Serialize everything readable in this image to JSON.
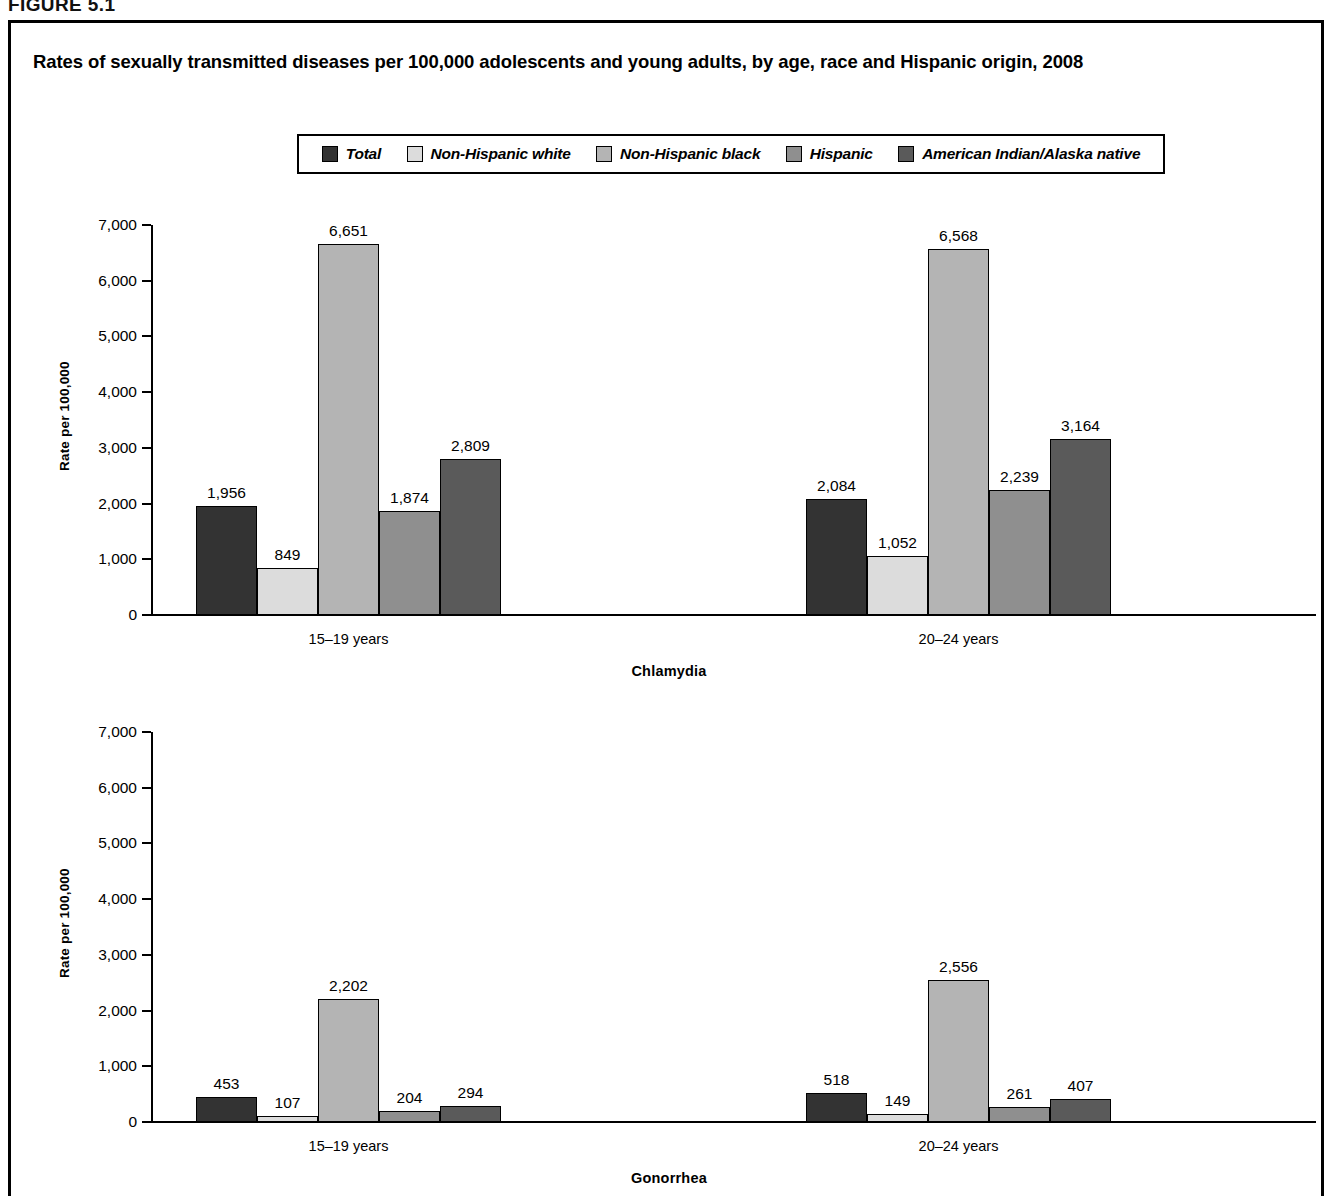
{
  "figure": {
    "label": "FIGURE 5.1",
    "title": "Rates of sexually transmitted diseases per 100,000 adolescents and young adults, by age, race and Hispanic origin, 2008"
  },
  "legend": {
    "items": [
      {
        "label": "Total",
        "color": "#333333"
      },
      {
        "label": "Non-Hispanic white",
        "color": "#dcdcdc"
      },
      {
        "label": "Non-Hispanic black",
        "color": "#b4b4b4"
      },
      {
        "label": "Hispanic",
        "color": "#8f8f8f"
      },
      {
        "label": "American Indian/Alaska native",
        "color": "#5a5a5a"
      }
    ]
  },
  "axis": {
    "ylabel": "Rate per 100,000",
    "ticks": [
      "7,000",
      "6,000",
      "5,000",
      "4,000",
      "3,000",
      "2,000",
      "1,000",
      "0"
    ]
  },
  "groups": {
    "g1": "15–19 years",
    "g2": "20–24 years"
  },
  "panels": {
    "chlamydia": {
      "label": "Chlamydia",
      "g1": {
        "values": [
          "1,956",
          "849",
          "6,651",
          "1,874",
          "2,809"
        ]
      },
      "g2": {
        "values": [
          "2,084",
          "1,052",
          "6,568",
          "2,239",
          "3,164"
        ]
      }
    },
    "gonorrhea": {
      "label": "Gonorrhea",
      "g1": {
        "values": [
          "453",
          "107",
          "2,202",
          "204",
          "294"
        ]
      },
      "g2": {
        "values": [
          "518",
          "149",
          "2,556",
          "261",
          "407"
        ]
      }
    }
  },
  "chart_data": {
    "type": "bar",
    "title": "Rates of sexually transmitted diseases per 100,000 adolescents and young adults, by age, race and Hispanic origin, 2008",
    "xlabel": "",
    "ylabel": "Rate per 100,000",
    "ylim": [
      0,
      7000
    ],
    "ytick_step": 1000,
    "grid": false,
    "legend_position": "top-center",
    "legend_entries": [
      "Total",
      "Non-Hispanic white",
      "Non-Hispanic black",
      "Hispanic",
      "American Indian/Alaska native"
    ],
    "panels": [
      {
        "name": "Chlamydia",
        "categories": [
          "15–19 years",
          "20–24 years"
        ],
        "series": [
          {
            "name": "Total",
            "values": [
              1956,
              2084
            ]
          },
          {
            "name": "Non-Hispanic white",
            "values": [
              849,
              1052
            ]
          },
          {
            "name": "Non-Hispanic black",
            "values": [
              6651,
              6568
            ]
          },
          {
            "name": "Hispanic",
            "values": [
              1874,
              2239
            ]
          },
          {
            "name": "American Indian/Alaska native",
            "values": [
              2809,
              3164
            ]
          }
        ]
      },
      {
        "name": "Gonorrhea",
        "categories": [
          "15–19 years",
          "20–24 years"
        ],
        "series": [
          {
            "name": "Total",
            "values": [
              453,
              518
            ]
          },
          {
            "name": "Non-Hispanic white",
            "values": [
              107,
              149
            ]
          },
          {
            "name": "Non-Hispanic black",
            "values": [
              2202,
              2556
            ]
          },
          {
            "name": "Hispanic",
            "values": [
              204,
              261
            ]
          },
          {
            "name": "American Indian/Alaska native",
            "values": [
              294,
              407
            ]
          }
        ]
      }
    ]
  }
}
